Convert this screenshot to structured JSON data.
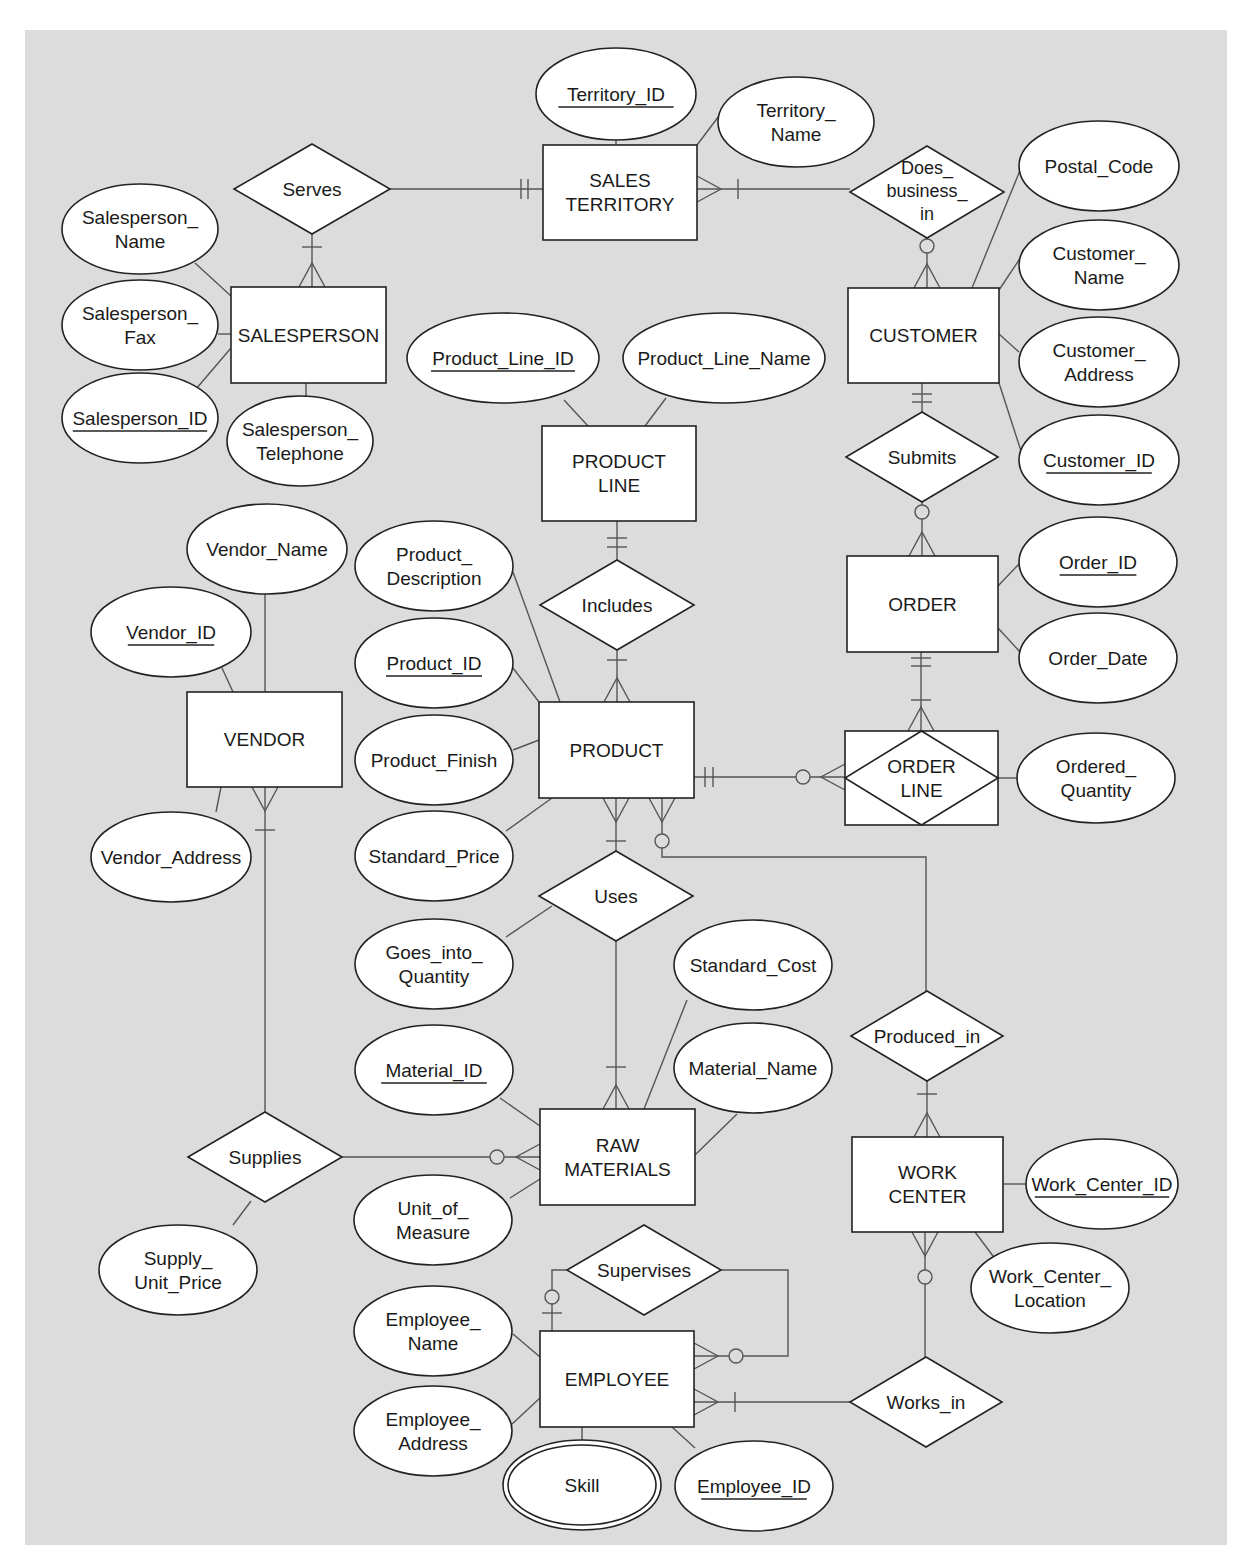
{
  "diagram": {
    "type": "Entity-Relationship Diagram (crow's foot notation)",
    "background_color": "#dcdcdc",
    "entities": [
      {
        "id": "sales_territory",
        "label": [
          "SALES",
          "TERRITORY"
        ]
      },
      {
        "id": "salesperson",
        "label": [
          "SALESPERSON"
        ]
      },
      {
        "id": "customer",
        "label": [
          "CUSTOMER"
        ]
      },
      {
        "id": "product_line",
        "label": [
          "PRODUCT",
          "LINE"
        ]
      },
      {
        "id": "order",
        "label": [
          "ORDER"
        ]
      },
      {
        "id": "vendor",
        "label": [
          "VENDOR"
        ]
      },
      {
        "id": "product",
        "label": [
          "PRODUCT"
        ]
      },
      {
        "id": "order_line",
        "label": [
          "ORDER",
          "LINE"
        ],
        "associative": true
      },
      {
        "id": "raw_materials",
        "label": [
          "RAW",
          "MATERIALS"
        ]
      },
      {
        "id": "work_center",
        "label": [
          "WORK",
          "CENTER"
        ]
      },
      {
        "id": "employee",
        "label": [
          "EMPLOYEE"
        ]
      }
    ],
    "relationships": [
      {
        "id": "serves",
        "label": [
          "Serves"
        ]
      },
      {
        "id": "does_business_in",
        "label": [
          "Does_",
          "business_",
          "in"
        ]
      },
      {
        "id": "submits",
        "label": [
          "Submits"
        ]
      },
      {
        "id": "includes",
        "label": [
          "Includes"
        ]
      },
      {
        "id": "uses",
        "label": [
          "Uses"
        ]
      },
      {
        "id": "produced_in",
        "label": [
          "Produced_in"
        ]
      },
      {
        "id": "supplies",
        "label": [
          "Supplies"
        ]
      },
      {
        "id": "supervises",
        "label": [
          "Supervises"
        ]
      },
      {
        "id": "works_in",
        "label": [
          "Works_in"
        ]
      }
    ],
    "attributes": [
      {
        "id": "territory_id",
        "label": [
          "Territory_ID"
        ],
        "key": true,
        "entity": "sales_territory"
      },
      {
        "id": "territory_name",
        "label": [
          "Territory_",
          "Name"
        ],
        "entity": "sales_territory"
      },
      {
        "id": "salesperson_name",
        "label": [
          "Salesperson_",
          "Name"
        ],
        "entity": "salesperson"
      },
      {
        "id": "salesperson_fax",
        "label": [
          "Salesperson_",
          "Fax"
        ],
        "entity": "salesperson"
      },
      {
        "id": "salesperson_id",
        "label": [
          "Salesperson_ID"
        ],
        "key": true,
        "entity": "salesperson"
      },
      {
        "id": "salesperson_telephone",
        "label": [
          "Salesperson_",
          "Telephone"
        ],
        "entity": "salesperson"
      },
      {
        "id": "postal_code",
        "label": [
          "Postal_Code"
        ],
        "entity": "customer"
      },
      {
        "id": "customer_name",
        "label": [
          "Customer_",
          "Name"
        ],
        "entity": "customer"
      },
      {
        "id": "customer_address",
        "label": [
          "Customer_",
          "Address"
        ],
        "entity": "customer"
      },
      {
        "id": "customer_id",
        "label": [
          "Customer_ID"
        ],
        "key": true,
        "entity": "customer"
      },
      {
        "id": "product_line_id",
        "label": [
          "Product_Line_ID"
        ],
        "key": true,
        "entity": "product_line"
      },
      {
        "id": "product_line_name",
        "label": [
          "Product_Line_Name"
        ],
        "entity": "product_line"
      },
      {
        "id": "order_id",
        "label": [
          "Order_ID"
        ],
        "key": true,
        "entity": "order"
      },
      {
        "id": "order_date",
        "label": [
          "Order_Date"
        ],
        "entity": "order"
      },
      {
        "id": "ordered_quantity",
        "label": [
          "Ordered_",
          "Quantity"
        ],
        "entity": "order_line"
      },
      {
        "id": "vendor_name",
        "label": [
          "Vendor_Name"
        ],
        "entity": "vendor"
      },
      {
        "id": "vendor_id",
        "label": [
          "Vendor_ID"
        ],
        "key": true,
        "entity": "vendor"
      },
      {
        "id": "vendor_address",
        "label": [
          "Vendor_Address"
        ],
        "entity": "vendor"
      },
      {
        "id": "product_description",
        "label": [
          "Product_",
          "Description"
        ],
        "entity": "product"
      },
      {
        "id": "product_id",
        "label": [
          "Product_ID"
        ],
        "key": true,
        "entity": "product"
      },
      {
        "id": "product_finish",
        "label": [
          "Product_Finish"
        ],
        "entity": "product"
      },
      {
        "id": "standard_price",
        "label": [
          "Standard_Price"
        ],
        "entity": "product"
      },
      {
        "id": "goes_into_quantity",
        "label": [
          "Goes_into_",
          "Quantity"
        ],
        "entity": "uses"
      },
      {
        "id": "standard_cost",
        "label": [
          "Standard_Cost"
        ],
        "entity": "raw_materials"
      },
      {
        "id": "material_id",
        "label": [
          "Material_ID"
        ],
        "key": true,
        "entity": "raw_materials"
      },
      {
        "id": "material_name",
        "label": [
          "Material_Name"
        ],
        "entity": "raw_materials"
      },
      {
        "id": "unit_of_measure",
        "label": [
          "Unit_of_",
          "Measure"
        ],
        "entity": "raw_materials"
      },
      {
        "id": "supply_unit_price",
        "label": [
          "Supply_",
          "Unit_Price"
        ],
        "entity": "supplies"
      },
      {
        "id": "work_center_id",
        "label": [
          "Work_Center_ID"
        ],
        "key": true,
        "entity": "work_center"
      },
      {
        "id": "work_center_location",
        "label": [
          "Work_Center_",
          "Location"
        ],
        "entity": "work_center"
      },
      {
        "id": "employee_name",
        "label": [
          "Employee_",
          "Name"
        ],
        "entity": "employee"
      },
      {
        "id": "employee_address",
        "label": [
          "Employee_",
          "Address"
        ],
        "entity": "employee"
      },
      {
        "id": "skill",
        "label": [
          "Skill"
        ],
        "multivalued": true,
        "entity": "employee"
      },
      {
        "id": "employee_id",
        "label": [
          "Employee_ID"
        ],
        "key": true,
        "entity": "employee"
      }
    ]
  }
}
